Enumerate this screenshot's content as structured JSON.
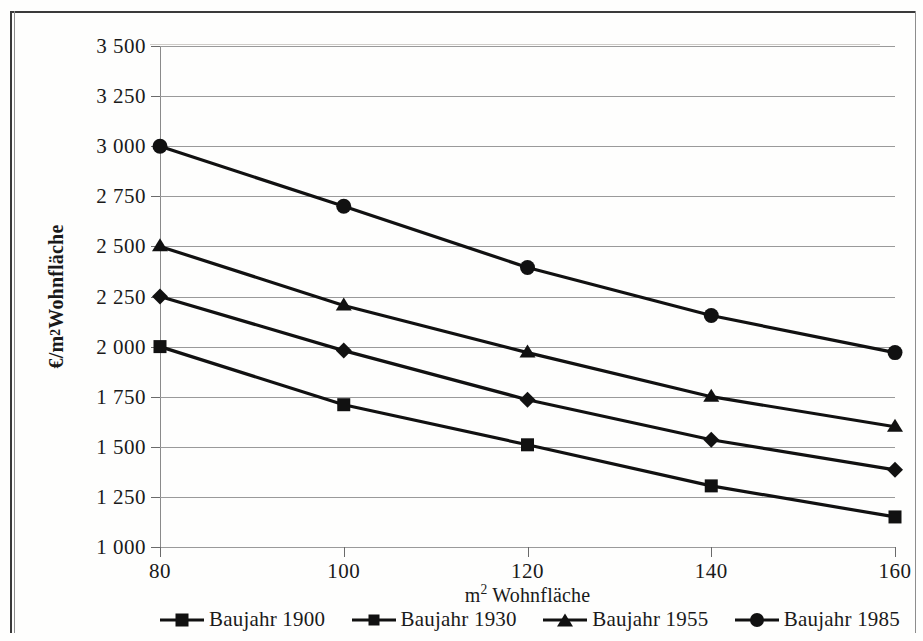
{
  "chart_data": {
    "type": "line",
    "title": "",
    "xlabel": "m² Wohnfläche",
    "ylabel": "€/m² Wohnfläche",
    "x": [
      80,
      100,
      120,
      140,
      160
    ],
    "xtick_labels": [
      "80",
      "100",
      "120",
      "140",
      "160"
    ],
    "ytick_labels": [
      "3 500",
      "3 250",
      "3 000",
      "2 750",
      "2 500",
      "2 250",
      "2 000",
      "1 750",
      "1 500",
      "1 250",
      "1 000"
    ],
    "yticks": [
      3500,
      3250,
      3000,
      2750,
      2500,
      2250,
      2000,
      1750,
      1500,
      1250,
      1000
    ],
    "xlim": [
      80,
      160
    ],
    "ylim": [
      1000,
      3500
    ],
    "grid": "horizontal",
    "legend_position": "bottom",
    "line_color": "#111111",
    "grid_color": "#9a9a9a",
    "series": [
      {
        "name": "Baujahr 1900",
        "marker": "square",
        "values": [
          2000,
          1710,
          1510,
          1305,
          1150
        ]
      },
      {
        "name": "Baujahr 1930",
        "marker": "diamond",
        "values": [
          2250,
          1980,
          1735,
          1535,
          1385
        ]
      },
      {
        "name": "Baujahr 1955",
        "marker": "triangle",
        "values": [
          2500,
          2205,
          1970,
          1750,
          1600
        ]
      },
      {
        "name": "Baujahr 1985",
        "marker": "circle",
        "values": [
          3000,
          2700,
          2395,
          2155,
          1970
        ]
      }
    ]
  },
  "legend": {
    "items": [
      {
        "label": "Baujahr 1900",
        "marker": "square"
      },
      {
        "label": "Baujahr 1930",
        "marker": "diamond"
      },
      {
        "label": "Baujahr 1955",
        "marker": "triangle"
      },
      {
        "label": "Baujahr 1985",
        "marker": "circle"
      }
    ]
  },
  "axes": {
    "y_label_prefix": "€/m",
    "y_label_sup": "2",
    "y_label_suffix": " Wohnfläche",
    "x_label_prefix": "m",
    "x_label_sup": "2",
    "x_label_suffix": " Wohnfläche"
  },
  "page_artifacts": {
    "ghost_line_1": "",
    "ghost_line_2": ""
  }
}
